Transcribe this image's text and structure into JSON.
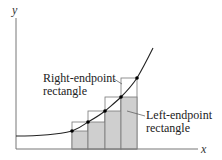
{
  "axes": {
    "x_label": "x",
    "y_label": "y"
  },
  "labels": {
    "right_line1": "Right-endpoint",
    "right_line2": "rectangle",
    "left_line1": "Left-endpoint",
    "left_line2": "rectangle"
  },
  "colors": {
    "fill": "#cfcfcf",
    "stroke": "#666666",
    "curve": "#222222",
    "axis": "#777777"
  }
}
